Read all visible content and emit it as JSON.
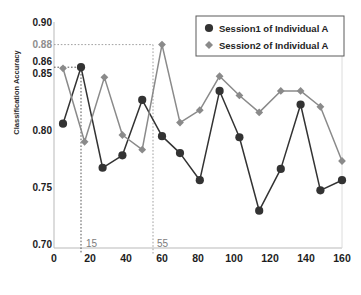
{
  "chart_data": {
    "type": "line",
    "title": "",
    "xlabel": "Kernel Size",
    "ylabel": "Classification Accuracy",
    "xlim": [
      0,
      160
    ],
    "ylim": [
      0.7,
      0.9
    ],
    "grid": false,
    "legend_position": "top-right",
    "xticks": [
      0,
      20,
      40,
      60,
      80,
      100,
      120,
      140,
      160
    ],
    "yticks": [
      "0.70",
      "0.75",
      "0.80",
      "0.85",
      "0.90"
    ],
    "annotation_yticks": [
      "0.86",
      "0.88"
    ],
    "annotations": [
      {
        "label": "15",
        "x": 15,
        "y": 0.86,
        "series": "Session1 of Individual A"
      },
      {
        "label": "55",
        "x": 55,
        "y": 0.88,
        "series": "Session2 of Individual A"
      }
    ],
    "series": [
      {
        "name": "Session1 of Individual A",
        "color": "#333333",
        "marker": "circle",
        "x": [
          5,
          15,
          27,
          38,
          49,
          60,
          70,
          81,
          92,
          103,
          114,
          126,
          137,
          148,
          160
        ],
        "values": [
          0.81,
          0.86,
          0.771,
          0.782,
          0.831,
          0.799,
          0.784,
          0.76,
          0.839,
          0.798,
          0.733,
          0.77,
          0.827,
          0.751,
          0.76
        ]
      },
      {
        "name": "Session2 of Individual A",
        "color": "#8a8a8a",
        "marker": "diamond",
        "x": [
          5,
          17,
          28,
          38,
          49,
          60,
          70,
          81,
          92,
          103,
          114,
          126,
          137,
          148,
          160
        ],
        "values": [
          0.859,
          0.794,
          0.851,
          0.8,
          0.787,
          0.88,
          0.811,
          0.822,
          0.852,
          0.835,
          0.82,
          0.839,
          0.839,
          0.825,
          0.777
        ]
      }
    ]
  },
  "legend": {
    "items": [
      {
        "label": "Session1 of Individual A",
        "marker": "circle",
        "color": "#333333"
      },
      {
        "label": "Session2 of Individual A",
        "marker": "diamond",
        "color": "#8a8a8a"
      }
    ]
  },
  "axes": {
    "y_label": "Classification Accuracy",
    "x_label": "Kernel Size",
    "y_ticks": [
      "0.90",
      "0.88",
      "0.86",
      "0.85",
      "0.80",
      "0.75",
      "0.70"
    ],
    "x_ticks": [
      "0",
      "20",
      "40",
      "60",
      "80",
      "100",
      "120",
      "140",
      "160"
    ]
  },
  "callouts": {
    "first": "15",
    "second": "55"
  }
}
